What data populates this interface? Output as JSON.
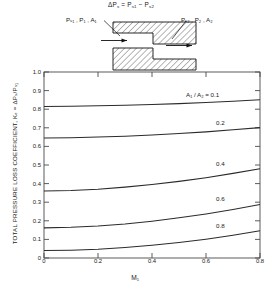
{
  "schematic": {
    "formula": "ΔPₛ = Pₛ₁ − Pₛ₂",
    "formula_parts": {
      "delta_ps": "ΔP",
      "s": "s",
      "equals": "=",
      "ps1": "P",
      "s1": "s1",
      "minus": "−",
      "ps2": "P",
      "s2": "s2"
    },
    "left_label": "Pₛ₁ , P₁ , A₁",
    "right_label": "Pₛ₂ , P₂ , A₂",
    "description": "sudden-expansion-duct"
  },
  "chart_data": {
    "type": "line",
    "title": "",
    "xlabel": "M₁",
    "ylabel": "TOTAL PRESSURE LOSS COEFFICIENT, Kₑ = ΔPₛ/Pₛ₁",
    "xlim": [
      0,
      0.8
    ],
    "ylim": [
      0,
      1.0
    ],
    "xticks": [
      0,
      0.2,
      0.4,
      0.6,
      0.8
    ],
    "xtick_labels": [
      "0",
      "0.2",
      "0.4",
      "0.6",
      "0.8"
    ],
    "yticks": [
      0,
      0.1,
      0.2,
      0.3,
      0.4,
      0.5,
      0.6,
      0.7,
      0.8,
      0.9,
      1.0
    ],
    "ytick_labels": [
      "0",
      "0.1",
      "0.2",
      "0.3",
      "0.4",
      "0.5",
      "0.6",
      "0.7",
      "0.8",
      "0.9",
      "1.0"
    ],
    "grid": false,
    "legend_position": "inline-right",
    "legend_prefix": "A₁ / A₂ =",
    "x": [
      0,
      0.1,
      0.2,
      0.3,
      0.4,
      0.5,
      0.6,
      0.7,
      0.8
    ],
    "series": [
      {
        "name": "0.1",
        "label": "A₁ / A₂ = 0.1",
        "values": [
          0.815,
          0.816,
          0.818,
          0.821,
          0.825,
          0.83,
          0.836,
          0.843,
          0.851
        ]
      },
      {
        "name": "0.2",
        "label": "0.2",
        "values": [
          0.645,
          0.647,
          0.65,
          0.655,
          0.661,
          0.669,
          0.678,
          0.689,
          0.701
        ]
      },
      {
        "name": "0.4",
        "label": "0.4",
        "values": [
          0.36,
          0.363,
          0.37,
          0.381,
          0.395,
          0.412,
          0.432,
          0.455,
          0.48
        ]
      },
      {
        "name": "0.6",
        "label": "0.6",
        "values": [
          0.162,
          0.165,
          0.172,
          0.183,
          0.198,
          0.216,
          0.237,
          0.261,
          0.288
        ]
      },
      {
        "name": "0.8",
        "label": "0.8",
        "values": [
          0.04,
          0.042,
          0.047,
          0.056,
          0.068,
          0.083,
          0.101,
          0.122,
          0.146
        ]
      }
    ]
  }
}
